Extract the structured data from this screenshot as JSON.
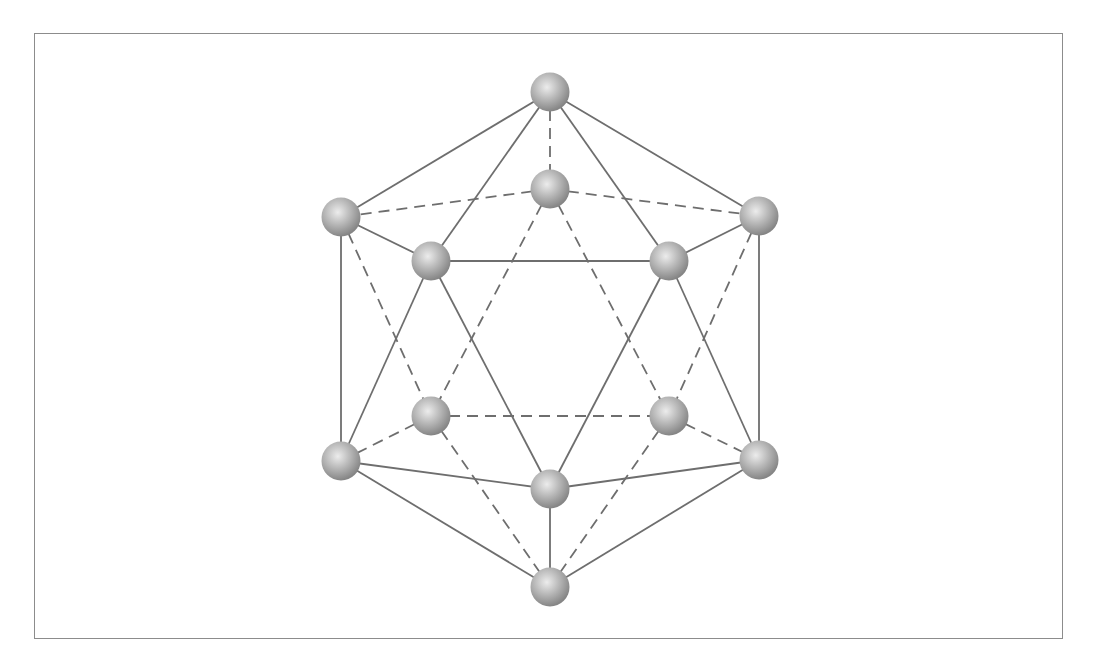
{
  "figure": {
    "title": "",
    "colors": {
      "edge": "#6e6e6e",
      "frame": "#8c8c8c",
      "atom_light": "#e6e6e6",
      "atom_mid": "#b4b4b4",
      "atom_dark": "#8a8a8a",
      "background": "#ffffff"
    },
    "vertices": [
      {
        "id": "top",
        "label": "",
        "position": "top"
      },
      {
        "id": "back-top",
        "label": "",
        "position": "back upper center"
      },
      {
        "id": "upper-left",
        "label": "",
        "position": "upper left"
      },
      {
        "id": "upper-right",
        "label": "",
        "position": "upper right"
      },
      {
        "id": "front-upper-left",
        "label": "",
        "position": "front upper left"
      },
      {
        "id": "front-upper-right",
        "label": "",
        "position": "front upper right"
      },
      {
        "id": "back-lower-left",
        "label": "",
        "position": "back lower left"
      },
      {
        "id": "back-lower-right",
        "label": "",
        "position": "back lower right"
      },
      {
        "id": "lower-left",
        "label": "",
        "position": "lower left"
      },
      {
        "id": "lower-right",
        "label": "",
        "position": "lower right"
      },
      {
        "id": "front-bottom",
        "label": "",
        "position": "front lower center"
      },
      {
        "id": "bottom",
        "label": "",
        "position": "bottom"
      }
    ],
    "edges": [
      {
        "from": "top",
        "to": "upper-left",
        "style": "solid"
      },
      {
        "from": "top",
        "to": "front-upper-left",
        "style": "solid"
      },
      {
        "from": "top",
        "to": "front-upper-right",
        "style": "solid"
      },
      {
        "from": "top",
        "to": "upper-right",
        "style": "solid"
      },
      {
        "from": "upper-left",
        "to": "front-upper-left",
        "style": "solid"
      },
      {
        "from": "front-upper-left",
        "to": "front-upper-right",
        "style": "solid"
      },
      {
        "from": "front-upper-right",
        "to": "upper-right",
        "style": "solid"
      },
      {
        "from": "upper-left",
        "to": "lower-left",
        "style": "solid"
      },
      {
        "from": "upper-right",
        "to": "lower-right",
        "style": "solid"
      },
      {
        "from": "front-upper-left",
        "to": "lower-left",
        "style": "solid"
      },
      {
        "from": "front-upper-left",
        "to": "front-bottom",
        "style": "solid"
      },
      {
        "from": "front-upper-right",
        "to": "front-bottom",
        "style": "solid"
      },
      {
        "from": "front-upper-right",
        "to": "lower-right",
        "style": "solid"
      },
      {
        "from": "lower-left",
        "to": "front-bottom",
        "style": "solid"
      },
      {
        "from": "front-bottom",
        "to": "lower-right",
        "style": "solid"
      },
      {
        "from": "lower-left",
        "to": "bottom",
        "style": "solid"
      },
      {
        "from": "front-bottom",
        "to": "bottom",
        "style": "solid"
      },
      {
        "from": "lower-right",
        "to": "bottom",
        "style": "solid"
      },
      {
        "from": "top",
        "to": "back-top",
        "style": "dashed"
      },
      {
        "from": "back-top",
        "to": "upper-left",
        "style": "dashed"
      },
      {
        "from": "back-top",
        "to": "upper-right",
        "style": "dashed"
      },
      {
        "from": "back-top",
        "to": "back-lower-left",
        "style": "dashed"
      },
      {
        "from": "back-top",
        "to": "back-lower-right",
        "style": "dashed"
      },
      {
        "from": "upper-left",
        "to": "back-lower-left",
        "style": "dashed"
      },
      {
        "from": "upper-right",
        "to": "back-lower-right",
        "style": "dashed"
      },
      {
        "from": "back-lower-left",
        "to": "back-lower-right",
        "style": "dashed"
      },
      {
        "from": "back-lower-left",
        "to": "lower-left",
        "style": "dashed"
      },
      {
        "from": "back-lower-right",
        "to": "lower-right",
        "style": "dashed"
      },
      {
        "from": "back-lower-left",
        "to": "bottom",
        "style": "dashed"
      },
      {
        "from": "back-lower-right",
        "to": "bottom",
        "style": "dashed"
      }
    ]
  }
}
